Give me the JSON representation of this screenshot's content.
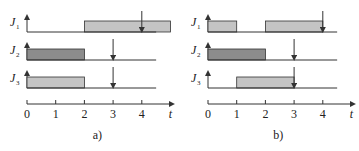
{
  "diagram": {
    "type": "schedule-gantt",
    "time_axis": {
      "label": "t",
      "ticks": [
        "0",
        "1",
        "2",
        "3",
        "4"
      ]
    },
    "colors": {
      "light_block": "#c4c4c4",
      "dark_block": "#8c8c8c",
      "line": "#333333"
    },
    "panels": [
      {
        "caption": "a)",
        "jobs": [
          {
            "label": "J",
            "sub": "1",
            "blocks": [
              [
                2,
                5
              ]
            ],
            "deadline": 4,
            "shade": "light"
          },
          {
            "label": "J",
            "sub": "2",
            "blocks": [
              [
                0,
                2
              ]
            ],
            "deadline": 3,
            "shade": "dark"
          },
          {
            "label": "J",
            "sub": "3",
            "blocks": [
              [
                0,
                2
              ]
            ],
            "deadline": 3,
            "shade": "light"
          }
        ]
      },
      {
        "caption": "b)",
        "jobs": [
          {
            "label": "J",
            "sub": "1",
            "blocks": [
              [
                0,
                1
              ],
              [
                2,
                4
              ]
            ],
            "deadline": 4,
            "shade": "light"
          },
          {
            "label": "J",
            "sub": "2",
            "blocks": [
              [
                0,
                2
              ]
            ],
            "deadline": 3,
            "shade": "dark"
          },
          {
            "label": "J",
            "sub": "3",
            "blocks": [
              [
                1,
                3
              ]
            ],
            "deadline": 3,
            "shade": "light"
          }
        ]
      }
    ]
  }
}
